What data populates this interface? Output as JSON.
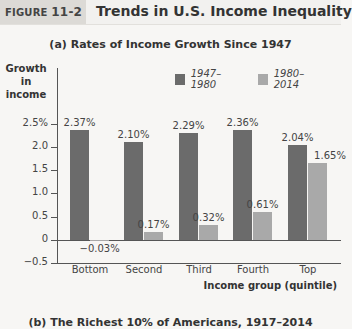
{
  "figure": {
    "label_word": "FIGURE ",
    "label_num": "11-2",
    "title": "Trends in U.S. Income Inequality"
  },
  "panel_a": {
    "subtitle": "(a) Rates of Income Growth Since 1947",
    "ylabel_line1": "Growth in",
    "ylabel_line2": "income",
    "xlabel": "Income group (quintile)",
    "legend": [
      {
        "label": "1947–1980",
        "color": "#6b6b6b"
      },
      {
        "label": "1980–2014",
        "color": "#a9a9a9"
      }
    ],
    "ticks": [
      "2.5%",
      "2.0",
      "1.5",
      "1.0",
      "0.5",
      "0",
      "−0.5"
    ],
    "categories": [
      "Bottom",
      "Second",
      "Third",
      "Fourth",
      "Top"
    ],
    "labels_1947": [
      "2.37%",
      "2.10%",
      "2.29%",
      "2.36%",
      "2.04%"
    ],
    "labels_1980": [
      "−0.03%",
      "0.17%",
      "0.32%",
      "0.61%",
      "1.65%"
    ]
  },
  "panel_b": {
    "subtitle": "(b) The Richest 10% of Americans, 1917–2014"
  },
  "chart_data": {
    "type": "bar",
    "title": "(a) Rates of Income Growth Since 1947",
    "xlabel": "Income group (quintile)",
    "ylabel": "Growth in income",
    "categories": [
      "Bottom",
      "Second",
      "Third",
      "Fourth",
      "Top"
    ],
    "series": [
      {
        "name": "1947–1980",
        "values": [
          2.37,
          2.1,
          2.29,
          2.36,
          2.04
        ],
        "color": "#6b6b6b"
      },
      {
        "name": "1980–2014",
        "values": [
          -0.03,
          0.17,
          0.32,
          0.61,
          1.65
        ],
        "color": "#a9a9a9"
      }
    ],
    "ylim": [
      -0.5,
      2.5
    ],
    "yticks": [
      -0.5,
      0,
      0.5,
      1.0,
      1.5,
      2.0,
      2.5
    ],
    "ytick_labels": [
      "−0.5",
      "0",
      "0.5",
      "1.0",
      "1.5",
      "2.0",
      "2.5%"
    ],
    "grid": false,
    "legend_position": "top-right",
    "value_labels": true,
    "units": "%"
  }
}
